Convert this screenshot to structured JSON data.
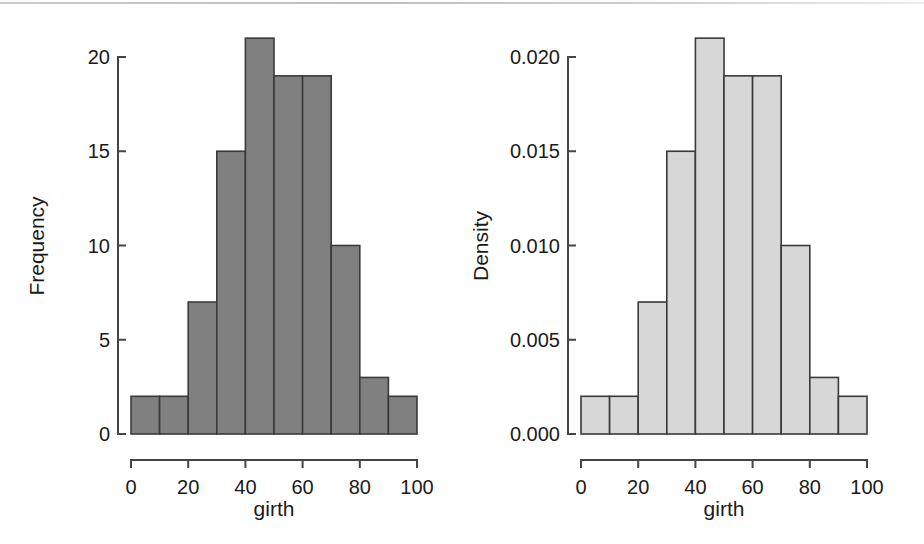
{
  "figure": {
    "width": 924,
    "height": 544,
    "background": "#ffffff",
    "panel_count": 2
  },
  "chart_data": [
    {
      "panel": "left",
      "type": "bar",
      "subtype": "histogram",
      "title": "",
      "xlabel": "girth",
      "ylabel": "Frequency",
      "bin_edges": [
        0,
        10,
        20,
        30,
        40,
        50,
        60,
        70,
        80,
        90,
        100
      ],
      "categories": [
        "0-10",
        "10-20",
        "20-30",
        "30-40",
        "40-50",
        "50-60",
        "60-70",
        "70-80",
        "80-90",
        "90-100"
      ],
      "values": [
        2,
        2,
        7,
        15,
        21,
        19,
        19,
        10,
        3,
        2
      ],
      "xlim": [
        0,
        100
      ],
      "ylim": [
        0,
        21
      ],
      "xticks": [
        0,
        20,
        40,
        60,
        80,
        100
      ],
      "xtick_labels": [
        "0",
        "20",
        "40",
        "60",
        "80",
        "100"
      ],
      "yticks": [
        0,
        5,
        10,
        15,
        20
      ],
      "ytick_labels": [
        "0",
        "5",
        "10",
        "15",
        "20"
      ],
      "grid": false,
      "legend": false,
      "bar_fill": "#808080",
      "bar_stroke": "#3a3a3a"
    },
    {
      "panel": "right",
      "type": "bar",
      "subtype": "histogram",
      "title": "",
      "xlabel": "girth",
      "ylabel": "Density",
      "bin_edges": [
        0,
        10,
        20,
        30,
        40,
        50,
        60,
        70,
        80,
        90,
        100
      ],
      "categories": [
        "0-10",
        "10-20",
        "20-30",
        "30-40",
        "40-50",
        "50-60",
        "60-70",
        "70-80",
        "80-90",
        "90-100"
      ],
      "values": [
        0.002,
        0.002,
        0.007,
        0.015,
        0.021,
        0.019,
        0.019,
        0.01,
        0.003,
        0.002
      ],
      "xlim": [
        0,
        100
      ],
      "ylim": [
        0,
        0.021
      ],
      "xticks": [
        0,
        20,
        40,
        60,
        80,
        100
      ],
      "xtick_labels": [
        "0",
        "20",
        "40",
        "60",
        "80",
        "100"
      ],
      "yticks": [
        0,
        0.005,
        0.01,
        0.015,
        0.02
      ],
      "ytick_labels": [
        "0.000",
        "0.005",
        "0.010",
        "0.015",
        "0.020"
      ],
      "grid": false,
      "legend": false,
      "bar_fill": "#d7d7d7",
      "bar_stroke": "#3a3a3a"
    }
  ],
  "left_panel": {
    "ylabel": "Frequency",
    "xlabel": "girth",
    "ytick_labels": [
      "20",
      "15",
      "10",
      "5",
      "0"
    ],
    "xtick_labels": [
      "0",
      "20",
      "40",
      "60",
      "80",
      "100"
    ]
  },
  "right_panel": {
    "ylabel": "Density",
    "xlabel": "girth",
    "ytick_labels": [
      "0.020",
      "0.015",
      "0.010",
      "0.005",
      "0.000"
    ],
    "xtick_labels": [
      "0",
      "20",
      "40",
      "60",
      "80",
      "100"
    ]
  }
}
